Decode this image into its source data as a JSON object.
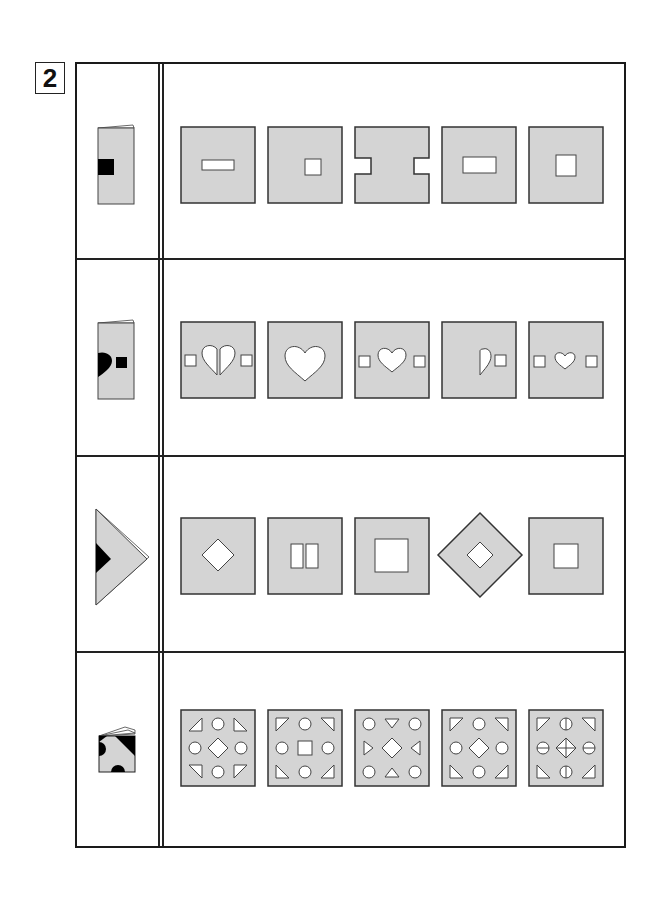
{
  "problem": {
    "number": "2"
  },
  "colors": {
    "paper_fill": "#d4d4d4",
    "hole_fill": "#ffffff",
    "ink": "#333333",
    "black_cut": "#000000"
  },
  "rows": [
    {
      "id": 1,
      "folded_figure": "paper folded in half vertically with black square cut on folded left edge",
      "options": [
        {
          "label": "option-1",
          "description": "square with horizontal rectangle hole in center"
        },
        {
          "label": "option-2",
          "description": "square with small square hole in center"
        },
        {
          "label": "option-3",
          "description": "square with rectangular notches on left and right edges"
        },
        {
          "label": "option-4",
          "description": "square with wide rectangle hole in center"
        },
        {
          "label": "option-5",
          "description": "square with medium square hole in center"
        }
      ]
    },
    {
      "id": 2,
      "folded_figure": "paper folded in half with half-heart cut on fold edge and black square",
      "options": [
        {
          "label": "option-1",
          "description": "two squares flanking a split heart"
        },
        {
          "label": "option-2",
          "description": "single large heart"
        },
        {
          "label": "option-3",
          "description": "heart flanked by two squares"
        },
        {
          "label": "option-4",
          "description": "half heart and one square on right"
        },
        {
          "label": "option-5",
          "description": "small heart flanked by two squares"
        }
      ]
    },
    {
      "id": 3,
      "folded_figure": "paper folded into triangle with black triangle cut on left edge",
      "options": [
        {
          "label": "option-1",
          "description": "square with diamond hole"
        },
        {
          "label": "option-2",
          "description": "square with two vertical rectangle holes"
        },
        {
          "label": "option-3",
          "description": "square with large square hole"
        },
        {
          "label": "option-4",
          "description": "diamond shape with diamond hole"
        },
        {
          "label": "option-5",
          "description": "square with medium square hole"
        }
      ]
    },
    {
      "id": 4,
      "folded_figure": "paper folded into quarters with black circle and triangle cuts",
      "options": [
        {
          "label": "option-1",
          "description": "3x3 pattern: triangles in corners, circles on edges, diamond in center"
        },
        {
          "label": "option-2",
          "description": "3x3 pattern: triangles in corners, circles on edges, square in center"
        },
        {
          "label": "option-3",
          "description": "3x3 pattern: circles in corners, triangles on edges, diamond in center"
        },
        {
          "label": "option-4",
          "description": "3x3 pattern: triangles in corners, circles on edges, diamond in center"
        },
        {
          "label": "option-5",
          "description": "3x3 pattern: triangles in corners, split circles on edges, crossed diamond in center"
        }
      ]
    }
  ]
}
